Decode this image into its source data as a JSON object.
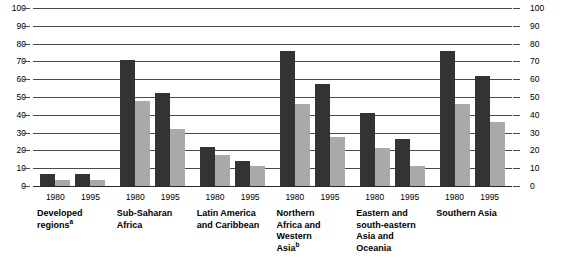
{
  "chart_data": {
    "type": "bar",
    "title": "",
    "xlabel": "",
    "ylabel": "",
    "ylim": [
      0,
      100
    ],
    "yticks": [
      0,
      10,
      20,
      30,
      40,
      50,
      60,
      70,
      80,
      90,
      100
    ],
    "grid": true,
    "legend_position": "none",
    "axis_left_labels": [
      "100",
      "90",
      "80",
      "70",
      "60",
      "50",
      "40",
      "30",
      "20",
      "10",
      "0"
    ],
    "axis_right_labels": [
      "100",
      "90",
      "80",
      "70",
      "60",
      "50",
      "40",
      "30",
      "20",
      "10",
      "0"
    ],
    "colors": {
      "series_dark": "#333333",
      "series_light": "#a9a9a9",
      "gridline": "#4a4a4a",
      "background": "#ffffff",
      "text": "#000000"
    },
    "year_labels": [
      "1980",
      "1995"
    ],
    "categories": [
      "Developed regions",
      "Sub-Saharan Africa",
      "Latin America and Caribbean",
      "Northern Africa and Western Asia",
      "Eastern and south-eastern Asia and Oceania",
      "Southern Asia"
    ],
    "groups": [
      {
        "category": "Developed regions",
        "category_lines": [
          "Developed",
          "regions"
        ],
        "footnote_marker": "a",
        "years": [
          {
            "year": "1980",
            "dark": 7,
            "light": 3.5
          },
          {
            "year": "1995",
            "dark": 7,
            "light": 3.5
          }
        ]
      },
      {
        "category": "Sub-Saharan Africa",
        "category_lines": [
          "Sub-Saharan",
          "Africa"
        ],
        "footnote_marker": "",
        "years": [
          {
            "year": "1980",
            "dark": 71,
            "light": 48
          },
          {
            "year": "1995",
            "dark": 52,
            "light": 32
          }
        ]
      },
      {
        "category": "Latin America and Caribbean",
        "category_lines": [
          "Latin America",
          "and Caribbean"
        ],
        "footnote_marker": "",
        "years": [
          {
            "year": "1980",
            "dark": 22,
            "light": 17.5
          },
          {
            "year": "1995",
            "dark": 14,
            "light": 11.5
          }
        ]
      },
      {
        "category": "Northern Africa and Western Asia",
        "category_lines": [
          "Northern",
          "Africa and",
          "Western",
          "Asia"
        ],
        "footnote_marker": "b",
        "years": [
          {
            "year": "1980",
            "dark": 76,
            "light": 46
          },
          {
            "year": "1995",
            "dark": 57.5,
            "light": 27.5
          }
        ]
      },
      {
        "category": "Eastern and south-eastern Asia and Oceania",
        "category_lines": [
          "Eastern and",
          "south-eastern",
          "Asia and",
          "Oceania"
        ],
        "footnote_marker": "",
        "years": [
          {
            "year": "1980",
            "dark": 41,
            "light": 21.5
          },
          {
            "year": "1995",
            "dark": 26.5,
            "light": 11
          }
        ]
      },
      {
        "category": "Southern Asia",
        "category_lines": [
          "Southern Asia"
        ],
        "footnote_marker": "",
        "years": [
          {
            "year": "1980",
            "dark": 76,
            "light": 46
          },
          {
            "year": "1995",
            "dark": 62,
            "light": 36
          }
        ]
      }
    ]
  },
  "footnote": ""
}
